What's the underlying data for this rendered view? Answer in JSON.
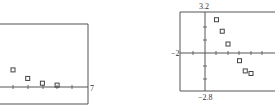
{
  "chart_data": [
    {
      "type": "scatter",
      "title": "",
      "xlabel": "",
      "ylabel": "",
      "tick_labels": {
        "x_max": "7"
      },
      "xlim": [
        1,
        7
      ],
      "grid": false,
      "marker": "square",
      "points": [
        {
          "x": 2,
          "y": 0.9
        },
        {
          "x": 3,
          "y": 0.45
        },
        {
          "x": 4,
          "y": 0.2
        },
        {
          "x": 5,
          "y": 0.1
        }
      ],
      "labels": {
        "xmax": "7"
      }
    },
    {
      "type": "scatter",
      "title": "",
      "xlabel": "",
      "ylabel": "",
      "xlim": [
        -2,
        6
      ],
      "ylim": [
        -2.8,
        3.2
      ],
      "grid": false,
      "marker": "square",
      "points": [
        {
          "x": 1,
          "y": 2.6
        },
        {
          "x": 1.5,
          "y": 1.7
        },
        {
          "x": 2,
          "y": 0.7
        },
        {
          "x": 3,
          "y": -0.6
        },
        {
          "x": 3.5,
          "y": -1.4
        },
        {
          "x": 4,
          "y": -1.6
        }
      ],
      "labels": {
        "ymax": "3.2",
        "ymin": "−2.8",
        "xmin": "−2"
      }
    }
  ]
}
